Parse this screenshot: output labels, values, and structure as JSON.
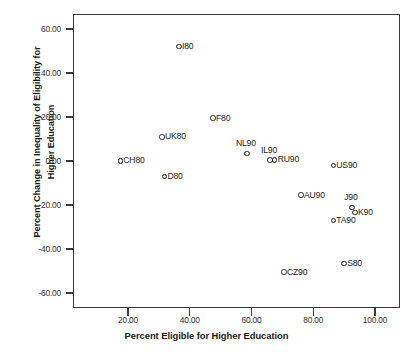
{
  "chart_data": {
    "type": "scatter",
    "title": "",
    "xlabel": "Percent Eligible for Higher Education",
    "ylabel": "Percent Change in Inequality of Eligibility for Higher Education",
    "ylabel_line1": "Percent Change in Inequality of Eligibility for",
    "ylabel_line2": "Higher Education",
    "xlim": [
      6,
      108
    ],
    "ylim": [
      -67,
      67
    ],
    "grid": false,
    "legend": "none",
    "xticks": [
      20,
      40,
      60,
      80,
      100
    ],
    "xtick_labels": [
      "20.00",
      "40.00",
      "60.00",
      "80.00",
      "100.00"
    ],
    "yticks": [
      60,
      40,
      20,
      0,
      -20,
      -40,
      -60
    ],
    "ytick_labels": [
      "60.00",
      "40.00",
      "20.00",
      "0.00",
      "-20.00",
      "-40.00",
      "-60.00"
    ],
    "marker": "open-circle",
    "marker_color": "#222222",
    "points": [
      {
        "label": "I80",
        "x": 36.5,
        "y": 52.0,
        "label_pos": "right"
      },
      {
        "label": "F80",
        "x": 47.5,
        "y": 19.5,
        "label_pos": "right"
      },
      {
        "label": "UK80",
        "x": 31.0,
        "y": 11.0,
        "label_pos": "right"
      },
      {
        "label": "CH80",
        "x": 17.5,
        "y": 0.0,
        "label_pos": "right"
      },
      {
        "label": "D80",
        "x": 31.8,
        "y": -7.0,
        "label_pos": "right"
      },
      {
        "label": "NL90",
        "x": 58.5,
        "y": 3.5,
        "label_pos": "above"
      },
      {
        "label": "IL90",
        "x": 66.0,
        "y": 0.5,
        "label_pos": "above"
      },
      {
        "label": "RU90",
        "x": 67.5,
        "y": 0.5,
        "label_pos": "right"
      },
      {
        "label": "US90",
        "x": 86.5,
        "y": -2.0,
        "label_pos": "right"
      },
      {
        "label": "AU90",
        "x": 76.0,
        "y": -15.5,
        "label_pos": "right"
      },
      {
        "label": "J90",
        "x": 92.5,
        "y": -21.0,
        "label_pos": "above"
      },
      {
        "label": "K90",
        "x": 93.5,
        "y": -23.5,
        "label_pos": "right"
      },
      {
        "label": "TA90",
        "x": 86.5,
        "y": -27.0,
        "label_pos": "right"
      },
      {
        "label": "S80",
        "x": 90.0,
        "y": -46.5,
        "label_pos": "right"
      },
      {
        "label": "CZ90",
        "x": 70.5,
        "y": -50.5,
        "label_pos": "right"
      }
    ]
  }
}
